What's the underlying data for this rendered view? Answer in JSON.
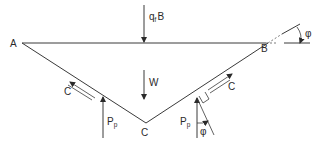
{
  "diagram": {
    "type": "free-body diagram of triangular soil wedge (bearing capacity)",
    "points": {
      "A": {
        "label": "A"
      },
      "B": {
        "label": "B"
      },
      "C": {
        "label": "C"
      }
    },
    "forces": {
      "surface_load": {
        "main": "q",
        "sub": "f",
        "suffix": "B"
      },
      "weight": {
        "label": "W"
      },
      "passive_left": {
        "main": "P",
        "sub": "p"
      },
      "passive_right": {
        "main": "P",
        "sub": "p"
      },
      "cohesion_left": {
        "label": "C"
      },
      "cohesion_right": {
        "label": "C"
      }
    },
    "angles": {
      "phi_base": {
        "label": "φ"
      },
      "phi_force": {
        "label": "φ"
      }
    },
    "colors": {
      "line": "#3a3a3a",
      "background": "#ffffff"
    }
  }
}
